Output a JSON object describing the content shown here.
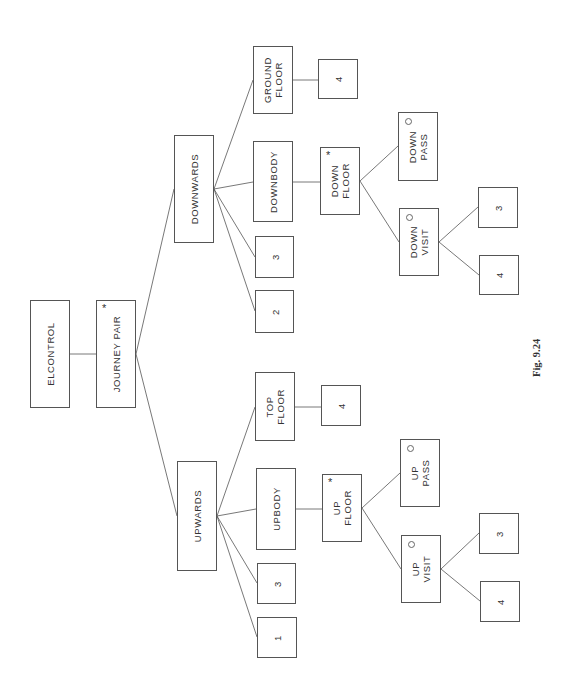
{
  "diagram": {
    "type": "jackson-structure-tree",
    "orientation": "rotated -90deg (root at left, leaves at right)",
    "caption": "Fig. 9.24",
    "nodes": {
      "elcontrol": {
        "label": "ELCONTROL"
      },
      "journey_pair": {
        "label": "JOURNEY PAIR",
        "marker": "*"
      },
      "downwards": {
        "label": "DOWNWARDS"
      },
      "upwards": {
        "label": "UPWARDS"
      },
      "ground_floor": {
        "label": "GROUND\nFLOOR"
      },
      "downbody": {
        "label": "DOWNBODY"
      },
      "down_3": {
        "label": "3"
      },
      "down_2": {
        "label": "2"
      },
      "top_floor": {
        "label": "TOP\nFLOOR"
      },
      "upbody": {
        "label": "UPBODY"
      },
      "up_3": {
        "label": "3"
      },
      "up_1": {
        "label": "1"
      },
      "ground_floor_4": {
        "label": "4"
      },
      "down_floor": {
        "label": "DOWN\nFLOOR",
        "marker": "*"
      },
      "top_floor_4": {
        "label": "4"
      },
      "up_floor": {
        "label": "UP\nFLOOR",
        "marker": "*"
      },
      "down_pass": {
        "label": "DOWN\nPASS",
        "marker": "o"
      },
      "down_visit": {
        "label": "DOWN\nVISIT",
        "marker": "o"
      },
      "down_visit_3": {
        "label": "3"
      },
      "down_visit_4": {
        "label": "4"
      },
      "up_pass": {
        "label": "UP\nPASS",
        "marker": "o"
      },
      "up_visit": {
        "label": "UP\nVISIT",
        "marker": "o"
      },
      "up_visit_3": {
        "label": "3"
      },
      "up_visit_4": {
        "label": "4"
      }
    },
    "edges": [
      [
        "elcontrol",
        "journey_pair"
      ],
      [
        "journey_pair",
        "upwards"
      ],
      [
        "journey_pair",
        "downwards"
      ],
      [
        "upwards",
        "up_1"
      ],
      [
        "upwards",
        "up_3"
      ],
      [
        "upwards",
        "upbody"
      ],
      [
        "upwards",
        "top_floor"
      ],
      [
        "downwards",
        "down_2"
      ],
      [
        "downwards",
        "down_3"
      ],
      [
        "downwards",
        "downbody"
      ],
      [
        "downwards",
        "ground_floor"
      ],
      [
        "top_floor",
        "top_floor_4"
      ],
      [
        "ground_floor",
        "ground_floor_4"
      ],
      [
        "upbody",
        "up_floor"
      ],
      [
        "downbody",
        "down_floor"
      ],
      [
        "up_floor",
        "up_visit"
      ],
      [
        "up_floor",
        "up_pass"
      ],
      [
        "down_floor",
        "down_visit"
      ],
      [
        "down_floor",
        "down_pass"
      ],
      [
        "up_visit",
        "up_visit_4"
      ],
      [
        "up_visit",
        "up_visit_3"
      ],
      [
        "down_visit",
        "down_visit_4"
      ],
      [
        "down_visit",
        "down_visit_3"
      ]
    ]
  }
}
